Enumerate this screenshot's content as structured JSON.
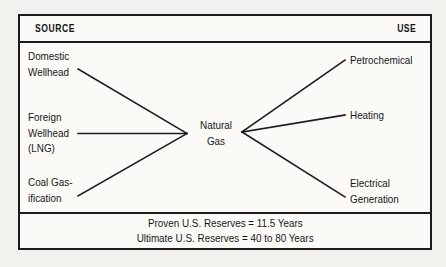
{
  "figure": {
    "title_bar": {
      "source_label": "SOURCE",
      "use_label": "USE"
    },
    "center_node": {
      "line1": "Natural",
      "line2": "Gas"
    },
    "sources": [
      {
        "id": "domestic-wellhead",
        "line1": "Domestic",
        "line2": "Wellhead",
        "line3": ""
      },
      {
        "id": "foreign-wellhead",
        "line1": "Foreign",
        "line2": "Wellhead",
        "line3": "(LNG)"
      },
      {
        "id": "coal-gasification",
        "line1": "Coal Gas-",
        "line2": "ification",
        "line3": ""
      }
    ],
    "uses": [
      {
        "id": "petrochemical",
        "line1": "Petrochemical",
        "line2": ""
      },
      {
        "id": "heating",
        "line1": "Heating",
        "line2": ""
      },
      {
        "id": "electrical-generation",
        "line1": "Electrical",
        "line2": "Generation"
      }
    ],
    "footer": {
      "line1": "Proven U.S. Reserves = 11.5 Years",
      "line2": "Ultimate U.S. Reserves = 40 to 80 Years"
    },
    "colors": {
      "ink": "#1c1c1c",
      "paper": "#fbfaf7",
      "page": "#f2f1ed"
    }
  }
}
